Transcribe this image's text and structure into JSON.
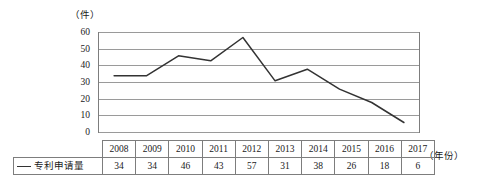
{
  "chart_data": {
    "type": "line",
    "title": "",
    "subtitle": "",
    "xlabel": "（年份）",
    "ylabel": "（件）",
    "unit_label": "（件）",
    "year_axis_label": "（年份）",
    "categories": [
      "2008",
      "2009",
      "2010",
      "2011",
      "2012",
      "2013",
      "2014",
      "2015",
      "2016",
      "2017"
    ],
    "values": [
      34,
      34,
      46,
      43,
      57,
      31,
      38,
      26,
      18,
      6
    ],
    "series": [
      {
        "name": "专利申请量",
        "values": [
          34,
          34,
          46,
          43,
          57,
          31,
          38,
          26,
          18,
          6
        ],
        "color": "#333333"
      }
    ],
    "ylim": [
      0,
      60
    ],
    "y_ticks": [
      "60",
      "50",
      "40",
      "30",
      "20",
      "10",
      "0"
    ],
    "y_tick_values": [
      60,
      50,
      40,
      30,
      20,
      10,
      0
    ],
    "grid": true,
    "grid_axis": "y",
    "legend_position": "table-row-left",
    "legend_entries": [
      "专利申请量"
    ]
  },
  "table": {
    "legend_row_label": "专利申请量",
    "legend_marker": "line-swatch",
    "year_row": [
      "2008",
      "2009",
      "2010",
      "2011",
      "2012",
      "2013",
      "2014",
      "2015",
      "2016",
      "2017"
    ],
    "value_row": [
      "34",
      "34",
      "46",
      "43",
      "57",
      "31",
      "38",
      "26",
      "18",
      "6"
    ]
  },
  "colors": {
    "line": "#333333",
    "gridline": "#9a9a9a",
    "axis": "#7d7d7d",
    "table_border": "#7d7d7d",
    "text": "#1a1a1a",
    "background": "#ffffff"
  }
}
